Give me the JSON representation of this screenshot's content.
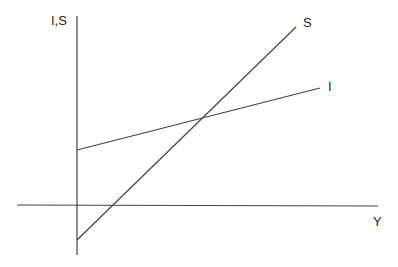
{
  "diagram": {
    "type": "economics-keynesian-saving-investment",
    "y_axis_label": "I,S",
    "x_axis_label": "Y",
    "colors": {
      "line": "#444444",
      "background": "#ffffff"
    },
    "axes": {
      "vertical": {
        "x": 77,
        "y1": 16,
        "y2": 255
      },
      "horizontal": {
        "y": 205,
        "x1": 17,
        "x2": 378
      }
    },
    "curves": [
      {
        "name": "Investment",
        "label": "I",
        "start": [
          77,
          150
        ],
        "end": [
          320,
          88
        ],
        "label_pos": [
          330,
          91
        ]
      },
      {
        "name": "Saving",
        "label": "S",
        "start": [
          77,
          240
        ],
        "end": [
          296,
          27
        ],
        "label_pos": [
          303,
          27
        ]
      }
    ],
    "intersection": [
      204,
      118
    ]
  }
}
